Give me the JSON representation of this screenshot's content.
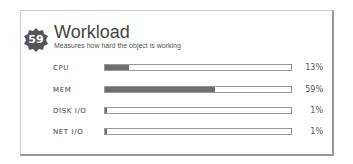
{
  "widget": {
    "badge_value": "59",
    "title": "Workload",
    "subtitle": "Measures how hard the object is working"
  },
  "metrics": [
    {
      "label": "CPU",
      "percent": 13,
      "percent_label": "13%"
    },
    {
      "label": "MEM",
      "percent": 59,
      "percent_label": "59%"
    },
    {
      "label": "DISK I/O",
      "percent": 1,
      "percent_label": "1%"
    },
    {
      "label": "NET I/O",
      "percent": 1,
      "percent_label": "1%"
    }
  ],
  "colors": {
    "bar_fill": "#6e6e6e",
    "bar_border": "#9a9a9a",
    "badge": "#555555"
  }
}
